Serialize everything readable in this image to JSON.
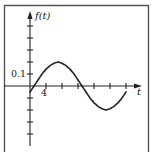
{
  "chart_data": {
    "type": "line",
    "title": "",
    "xlabel": "t",
    "ylabel": "f(t)",
    "x_tick_labels": [
      {
        "value": 4,
        "label": "4"
      }
    ],
    "y_tick_labels": [
      {
        "value": 0.1,
        "label": "0.1"
      }
    ],
    "x_tick_step": 4,
    "y_tick_step": 0.1,
    "x_ticks": [
      4,
      8,
      12,
      16,
      20,
      24
    ],
    "y_ticks": [
      -0.5,
      -0.4,
      -0.3,
      -0.2,
      -0.1,
      0.1,
      0.2,
      0.3,
      0.4,
      0.5
    ],
    "xlim": [
      0,
      28
    ],
    "ylim": [
      -0.5,
      0.6
    ],
    "grid": false,
    "legend": null,
    "series": [
      {
        "name": "f(t)",
        "x": [
          0,
          1,
          2,
          3,
          4,
          5,
          6,
          7,
          8,
          9,
          10,
          11,
          12,
          13,
          14,
          15,
          16,
          17,
          18,
          19,
          20,
          21,
          22,
          23,
          24
        ],
        "values": [
          -0.05,
          0.0,
          0.05,
          0.1,
          0.14,
          0.17,
          0.19,
          0.2,
          0.19,
          0.17,
          0.14,
          0.1,
          0.05,
          0.0,
          -0.05,
          -0.1,
          -0.14,
          -0.17,
          -0.19,
          -0.2,
          -0.19,
          -0.17,
          -0.14,
          -0.1,
          -0.05
        ]
      }
    ]
  },
  "labels": {
    "y_axis": "f(t)",
    "x_axis": "t",
    "y_tick": "0.1",
    "x_tick": "4"
  }
}
